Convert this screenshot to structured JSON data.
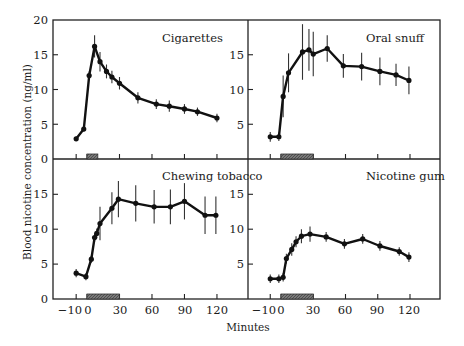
{
  "chart_data": {
    "type": "line",
    "xlabel": "Minutes",
    "ylabel": "Blood nicotine concentration (ng/ml)",
    "ylim": [
      0,
      20
    ],
    "xlim": [
      -18,
      140
    ],
    "yticks": [
      0,
      5,
      10,
      15,
      20
    ],
    "xticks": [
      -10,
      0,
      30,
      60,
      90,
      120
    ],
    "xtick_labels": [
      "−10",
      "0",
      "30",
      "60",
      "90",
      "120"
    ],
    "grid": false,
    "legend": null,
    "panels": [
      {
        "title": "Cigarettes",
        "position": "top-left",
        "exposure_bar": [
          0,
          10
        ],
        "x": [
          -10,
          -3,
          2,
          7,
          12,
          18,
          23,
          30,
          47,
          64,
          76,
          90,
          102,
          120
        ],
        "y": [
          2.9,
          4.3,
          12.0,
          16.2,
          14.0,
          12.6,
          11.8,
          10.9,
          8.8,
          7.9,
          7.6,
          7.2,
          6.8,
          5.9
        ],
        "err": [
          0.3,
          0.3,
          0.6,
          1.6,
          1.4,
          1.0,
          0.9,
          0.9,
          0.8,
          0.7,
          0.8,
          0.7,
          0.6,
          0.6
        ]
      },
      {
        "title": "Oral snuff",
        "position": "top-right",
        "exposure_bar": [
          0,
          30
        ],
        "x": [
          -10,
          -2,
          2,
          7,
          20,
          26,
          30,
          43,
          58,
          75,
          92,
          107,
          119
        ],
        "y": [
          3.2,
          3.2,
          9.0,
          12.4,
          15.4,
          15.7,
          15.1,
          15.9,
          13.4,
          13.3,
          12.6,
          12.1,
          11.3
        ],
        "err": [
          0.7,
          0.6,
          3.0,
          2.8,
          4.0,
          3.0,
          3.2,
          1.9,
          1.7,
          2.0,
          2.0,
          1.6,
          2.0
        ]
      },
      {
        "title": "Chewing tobacco",
        "position": "bottom-left",
        "exposure_bar": [
          0,
          30
        ],
        "x": [
          -10,
          -1,
          4,
          7,
          9,
          12,
          23,
          29,
          45,
          62,
          77,
          90,
          109,
          119
        ],
        "y": [
          3.7,
          3.2,
          5.7,
          8.8,
          9.4,
          10.8,
          13.0,
          14.3,
          13.7,
          13.2,
          13.2,
          14.0,
          12.0,
          12.0
        ],
        "err": [
          0.6,
          0.5,
          0.5,
          0.6,
          0.7,
          2.4,
          2.3,
          2.6,
          2.6,
          2.4,
          2.5,
          2.6,
          2.7,
          2.7
        ]
      },
      {
        "title": "Nicotine gum",
        "position": "bottom-right",
        "exposure_bar": [
          0,
          30
        ],
        "x": [
          -10,
          -2,
          2,
          5,
          10,
          14,
          19,
          27,
          42,
          59,
          76,
          92,
          110,
          119
        ],
        "y": [
          2.9,
          2.9,
          3.1,
          5.8,
          7.1,
          8.2,
          9.0,
          9.3,
          8.9,
          7.9,
          8.6,
          7.6,
          6.8,
          6.0
        ],
        "err": [
          0.6,
          0.6,
          0.6,
          0.7,
          0.9,
          0.8,
          1.0,
          1.1,
          0.7,
          0.7,
          0.7,
          0.7,
          0.6,
          0.7
        ]
      }
    ]
  },
  "labels": {
    "ylabel": "Blood nicotine concentration (ng/ml)",
    "xlabel": "Minutes",
    "titles": [
      "Cigarettes",
      "Oral snuff",
      "Chewing tobacco",
      "Nicotine gum"
    ],
    "yticks": [
      "20",
      "15",
      "10",
      "5",
      "0"
    ],
    "xticks": [
      "−10",
      "0",
      "30",
      "60",
      "90",
      "120"
    ]
  }
}
